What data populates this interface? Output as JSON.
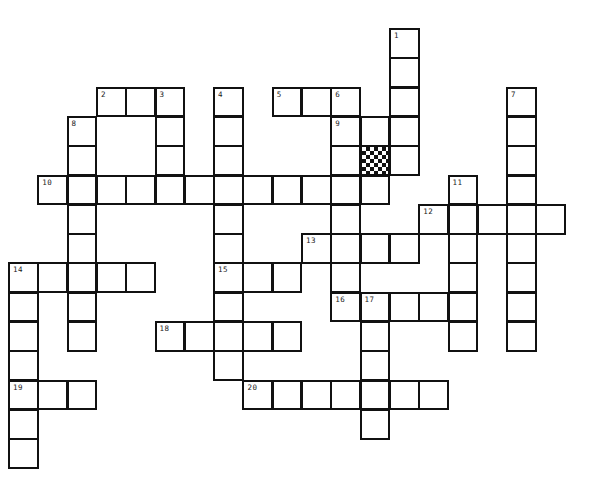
{
  "puzzle": {
    "type": "crossword",
    "cell_size": 29.3,
    "origin": {
      "x": 9,
      "y": 29
    },
    "colors": {
      "line": "#111111",
      "background": "#ffffff"
    },
    "entries": [
      {
        "number": 1,
        "direction": "down",
        "col": 13,
        "row": 0,
        "length": 5
      },
      {
        "number": 2,
        "direction": "across",
        "col": 3,
        "row": 2,
        "length": 3
      },
      {
        "number": 3,
        "direction": "down",
        "col": 5,
        "row": 2,
        "length": 4
      },
      {
        "number": 4,
        "direction": "down",
        "col": 7,
        "row": 2,
        "length": 10
      },
      {
        "number": 5,
        "direction": "across",
        "col": 9,
        "row": 2,
        "length": 3
      },
      {
        "number": 6,
        "direction": "down",
        "col": 11,
        "row": 2,
        "length": 8
      },
      {
        "number": 7,
        "direction": "down",
        "col": 17,
        "row": 2,
        "length": 9
      },
      {
        "number": 8,
        "direction": "down",
        "col": 2,
        "row": 3,
        "length": 8
      },
      {
        "number": 9,
        "direction": "across",
        "col": 11,
        "row": 3,
        "length": 3
      },
      {
        "number": 10,
        "direction": "across",
        "col": 1,
        "row": 5,
        "length": 12
      },
      {
        "number": 11,
        "direction": "down",
        "col": 15,
        "row": 5,
        "length": 6
      },
      {
        "number": 12,
        "direction": "across",
        "col": 14,
        "row": 6,
        "length": 5
      },
      {
        "number": 13,
        "direction": "across",
        "col": 10,
        "row": 7,
        "length": 4
      },
      {
        "number": 14,
        "direction": "across",
        "col": 0,
        "row": 8,
        "length": 5
      },
      {
        "number": 14,
        "direction": "down",
        "col": 0,
        "row": 8,
        "length": 7
      },
      {
        "number": 15,
        "direction": "across",
        "col": 7,
        "row": 8,
        "length": 3
      },
      {
        "number": 16,
        "direction": "across",
        "col": 11,
        "row": 9,
        "length": 5
      },
      {
        "number": 17,
        "direction": "down",
        "col": 12,
        "row": 9,
        "length": 5
      },
      {
        "number": 18,
        "direction": "across",
        "col": 5,
        "row": 10,
        "length": 5
      },
      {
        "number": 19,
        "direction": "across",
        "col": 0,
        "row": 12,
        "length": 3
      },
      {
        "number": 20,
        "direction": "across",
        "col": 8,
        "row": 12,
        "length": 7
      }
    ],
    "extra_cells": [
      {
        "col": 11,
        "row": 4
      },
      {
        "col": 13,
        "row": 4
      }
    ],
    "blocked_cells": [
      {
        "col": 12,
        "row": 4
      }
    ]
  }
}
